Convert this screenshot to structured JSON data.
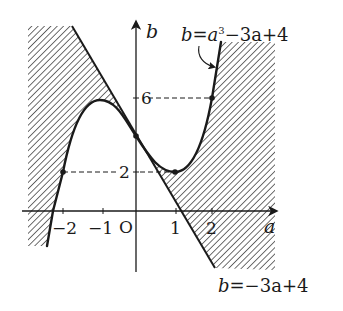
{
  "diagram": {
    "type": "function-graph-with-shaded-region",
    "axes": {
      "x_label": "a",
      "y_label": "b",
      "origin_label": "O",
      "x_ticks": [
        "−2",
        "−1",
        "1",
        "2"
      ],
      "y_ticks": [
        "2",
        "6"
      ]
    },
    "curves": [
      {
        "id": "cubic",
        "label": "b = a³ − 3a + 4",
        "label_parts": {
          "lhs": "b=",
          "base": "a",
          "exp": "3",
          "rest": "−3a+4"
        }
      },
      {
        "id": "tangent-line",
        "label": "b = −3a + 4",
        "label_parts": {
          "lhs": "b=",
          "rest": "−3a+4"
        }
      }
    ],
    "marked_points": [
      {
        "a": -2,
        "b": 2
      },
      {
        "a": -1,
        "b": 6,
        "note": "local max (not dotted)"
      },
      {
        "a": 0,
        "b": 4
      },
      {
        "a": 1,
        "b": 2
      },
      {
        "a": 2,
        "b": 6
      }
    ],
    "guide_lines": [
      {
        "from_a": -2,
        "to_a": 0,
        "b": 2,
        "style": "dashed"
      },
      {
        "from_a": 0,
        "to_a": 1,
        "b": 2,
        "style": "dashed"
      },
      {
        "from_a": 0,
        "to_a": 2,
        "b": 6,
        "style": "dashed"
      }
    ],
    "shaded_regions": [
      "left region between line and cubic",
      "right region between line and cubic"
    ],
    "colors": {
      "ink": "#1a1a1a",
      "hatch": "#555555",
      "background": "#ffffff"
    }
  }
}
